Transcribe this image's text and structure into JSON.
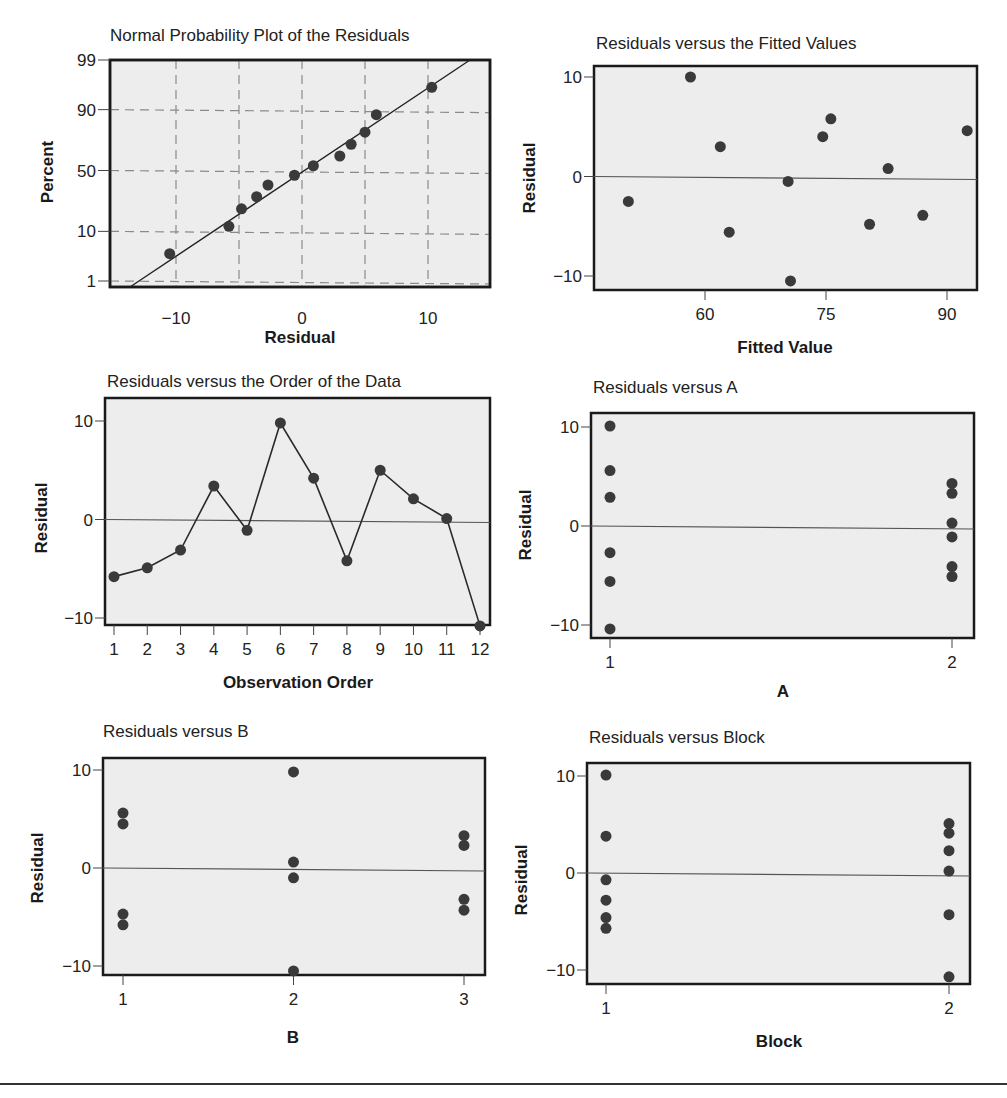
{
  "chart_data": [
    {
      "id": "normal-prob",
      "type": "scatter",
      "title": "Normal Probability Plot of the Residuals",
      "xlabel": "Residual",
      "ylabel": "Percent",
      "xlim": [
        -15,
        15
      ],
      "x_ticks": [
        -10,
        0,
        10
      ],
      "y_ticks": [
        1,
        10,
        50,
        90,
        99
      ],
      "grid": true,
      "fit_line": true,
      "points": [
        {
          "x": -10.5,
          "y": 4
        },
        {
          "x": -5.8,
          "y": 12
        },
        {
          "x": -4.8,
          "y": 21
        },
        {
          "x": -3.6,
          "y": 29
        },
        {
          "x": -2.7,
          "y": 38
        },
        {
          "x": -0.6,
          "y": 46
        },
        {
          "x": 0.9,
          "y": 54
        },
        {
          "x": 3.0,
          "y": 62
        },
        {
          "x": 3.9,
          "y": 71
        },
        {
          "x": 5.0,
          "y": 79
        },
        {
          "x": 5.9,
          "y": 88
        },
        {
          "x": 10.3,
          "y": 96
        }
      ]
    },
    {
      "id": "fitted",
      "type": "scatter",
      "title": "Residuals versus the Fitted Values",
      "xlabel": "Fitted Value",
      "ylabel": "Residual",
      "x_ticks": [
        60,
        75,
        90
      ],
      "y_ticks": [
        -10,
        0,
        10
      ],
      "ylim": [
        -11.5,
        11
      ],
      "zero_line": true,
      "points": [
        {
          "x": 50.5,
          "y": -2.5
        },
        {
          "x": 58.2,
          "y": 10.0
        },
        {
          "x": 61.9,
          "y": 3.0
        },
        {
          "x": 63.0,
          "y": -5.6
        },
        {
          "x": 70.3,
          "y": -0.5
        },
        {
          "x": 70.6,
          "y": -10.5
        },
        {
          "x": 74.6,
          "y": 4.0
        },
        {
          "x": 75.6,
          "y": 5.8
        },
        {
          "x": 80.4,
          "y": -4.8
        },
        {
          "x": 82.7,
          "y": 0.8
        },
        {
          "x": 87.0,
          "y": -3.9
        },
        {
          "x": 92.5,
          "y": 4.6
        }
      ]
    },
    {
      "id": "order",
      "type": "line",
      "title": "Residuals versus the Order of the Data",
      "xlabel": "Observation Order",
      "ylabel": "Residual",
      "x_ticks": [
        1,
        2,
        3,
        4,
        5,
        6,
        7,
        8,
        9,
        10,
        11,
        12
      ],
      "y_ticks": [
        -10,
        0,
        10
      ],
      "zero_line": true,
      "x": [
        1,
        2,
        3,
        4,
        5,
        6,
        7,
        8,
        9,
        10,
        11,
        12
      ],
      "values": [
        -5.8,
        -4.9,
        -3.1,
        3.4,
        -1.1,
        9.8,
        4.2,
        -4.2,
        5.0,
        2.1,
        0.1,
        -10.8
      ]
    },
    {
      "id": "vs-a",
      "type": "scatter",
      "title": "Residuals versus A",
      "xlabel": "A",
      "ylabel": "Residual",
      "x_ticks": [
        1,
        2
      ],
      "y_ticks": [
        -10,
        0,
        10
      ],
      "zero_line": true,
      "points": [
        {
          "x": 1,
          "y": 10.1
        },
        {
          "x": 1,
          "y": 5.6
        },
        {
          "x": 1,
          "y": 2.9
        },
        {
          "x": 1,
          "y": -2.7
        },
        {
          "x": 1,
          "y": -5.6
        },
        {
          "x": 1,
          "y": -10.4
        },
        {
          "x": 2,
          "y": 4.3
        },
        {
          "x": 2,
          "y": 3.3
        },
        {
          "x": 2,
          "y": 0.3
        },
        {
          "x": 2,
          "y": -1.1
        },
        {
          "x": 2,
          "y": -4.1
        },
        {
          "x": 2,
          "y": -5.1
        }
      ]
    },
    {
      "id": "vs-b",
      "type": "scatter",
      "title": "Residuals versus B",
      "xlabel": "B",
      "ylabel": "Residual",
      "x_ticks": [
        1,
        2,
        3
      ],
      "y_ticks": [
        -10,
        0,
        10
      ],
      "zero_line": true,
      "points": [
        {
          "x": 1,
          "y": 5.6
        },
        {
          "x": 1,
          "y": 4.5
        },
        {
          "x": 1,
          "y": -4.7
        },
        {
          "x": 1,
          "y": -5.8
        },
        {
          "x": 2,
          "y": 9.8
        },
        {
          "x": 2,
          "y": 0.6
        },
        {
          "x": 2,
          "y": -1.0
        },
        {
          "x": 2,
          "y": -10.5
        },
        {
          "x": 3,
          "y": 3.3
        },
        {
          "x": 3,
          "y": 2.3
        },
        {
          "x": 3,
          "y": -3.2
        },
        {
          "x": 3,
          "y": -4.3
        }
      ]
    },
    {
      "id": "vs-block",
      "type": "scatter",
      "title": "Residuals versus Block",
      "xlabel": "Block",
      "ylabel": "Residual",
      "x_ticks": [
        1,
        2
      ],
      "y_ticks": [
        -10,
        0,
        10
      ],
      "zero_line": true,
      "points": [
        {
          "x": 1,
          "y": 10.1
        },
        {
          "x": 1,
          "y": 3.8
        },
        {
          "x": 1,
          "y": -0.7
        },
        {
          "x": 1,
          "y": -2.8
        },
        {
          "x": 1,
          "y": -4.6
        },
        {
          "x": 1,
          "y": -5.7
        },
        {
          "x": 2,
          "y": 5.1
        },
        {
          "x": 2,
          "y": 4.1
        },
        {
          "x": 2,
          "y": 2.3
        },
        {
          "x": 2,
          "y": 0.2
        },
        {
          "x": 2,
          "y": -4.3
        },
        {
          "x": 2,
          "y": -10.7
        }
      ]
    }
  ],
  "style": {
    "plot_bg": "#ededed",
    "frame": "#1a1a1a",
    "point": "#3a3a3a",
    "grid": "#8a8a8a",
    "zero_line": "#555555"
  }
}
